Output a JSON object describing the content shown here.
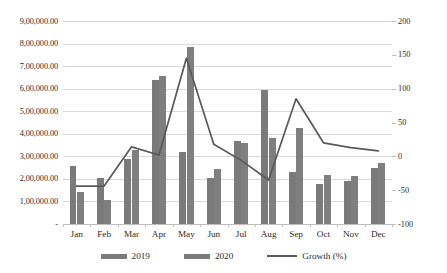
{
  "chart_data": {
    "type": "bar",
    "title": "",
    "subtitle": "",
    "xlabel": "",
    "ylabel": "",
    "categories": [
      "Jan",
      "Feb",
      "Mar",
      "Apr",
      "May",
      "Jun",
      "Jul",
      "Aug",
      "Sep",
      "Oct",
      "Nov",
      "Dec"
    ],
    "series": [
      {
        "name": "2019",
        "type": "bar",
        "axis": "left",
        "color": "#7a7a7a",
        "values": [
          255000,
          202000,
          287000,
          638000,
          320000,
          205000,
          366000,
          595000,
          229000,
          178000,
          190000,
          250000
        ]
      },
      {
        "name": "2020",
        "type": "bar",
        "axis": "left",
        "color": "#7f7f7f",
        "values": [
          142000,
          108000,
          328000,
          656000,
          784000,
          242000,
          358000,
          383000,
          426000,
          217000,
          215000,
          270000
        ]
      },
      {
        "name": "Growth (%)",
        "type": "line",
        "axis": "right",
        "color": "#595959",
        "values": [
          -44,
          -44,
          14,
          2,
          145,
          18,
          -6,
          -35,
          85,
          20,
          13,
          8
        ]
      }
    ],
    "left_axis": {
      "ticks": [
        "-",
        "1,00,000.00",
        "2,00,000.00",
        "3,00,000.00",
        "4,00,000.00",
        "5,00,000.00",
        "6,00,000.00",
        "7,00,000.00",
        "8,00,000.00",
        "9,00,000.00"
      ],
      "tick_values": [
        0,
        100000,
        200000,
        300000,
        400000,
        500000,
        600000,
        700000,
        800000,
        900000
      ],
      "min": 0,
      "max": 900000
    },
    "right_axis": {
      "ticks": [
        "-100",
        "-50",
        "0",
        "50",
        "100",
        "150",
        "200"
      ],
      "tick_values": [
        -100,
        -50,
        0,
        50,
        100,
        150,
        200
      ],
      "min": -100,
      "max": 200
    },
    "grid": true,
    "legend_position": "bottom",
    "legend": [
      "2019",
      "2020",
      "Growth (%)"
    ]
  }
}
